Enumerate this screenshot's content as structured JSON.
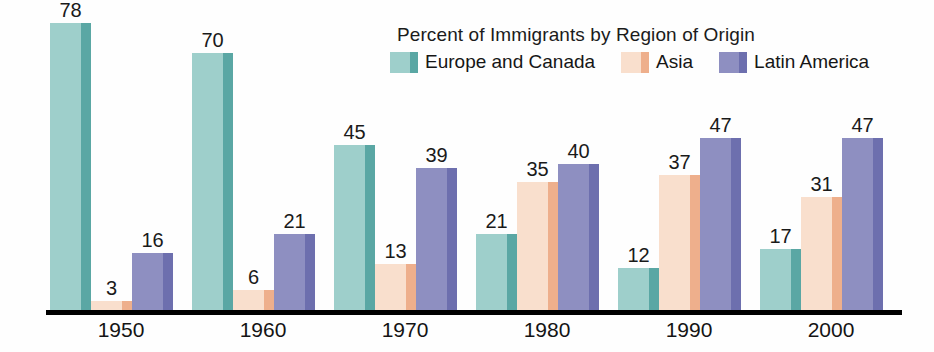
{
  "chart_data": {
    "type": "bar",
    "title": "Percent of Immigrants by Region of Origin",
    "xlabel": "",
    "ylabel": "",
    "ylim": [
      0,
      80
    ],
    "grid": false,
    "legend_position": "top",
    "categories": [
      "1950",
      "1960",
      "1970",
      "1980",
      "1990",
      "2000"
    ],
    "series": [
      {
        "name": "Europe and Canada",
        "color": "#9ecfcb",
        "edge_color": "#5aa7a4",
        "values": [
          78,
          70,
          45,
          21,
          12,
          17
        ]
      },
      {
        "name": "Asia",
        "color": "#f9dfcd",
        "edge_color": "#eeaf8c",
        "values": [
          3,
          6,
          13,
          35,
          37,
          31
        ]
      },
      {
        "name": "Latin America",
        "color": "#8e8fc1",
        "edge_color": "#6d6fae",
        "values": [
          16,
          21,
          39,
          40,
          47,
          47
        ]
      }
    ]
  },
  "axis": {
    "baseline_color": "#000000"
  }
}
